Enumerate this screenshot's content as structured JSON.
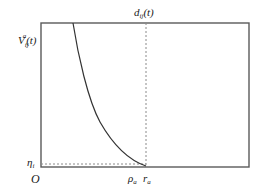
{
  "diagram": {
    "type": "function-plot",
    "labels": {
      "y_top": "V",
      "y_top_sub": "ij",
      "y_top_sup": "a",
      "y_top_arg": "(t)",
      "y_bottom": "η",
      "y_bottom_sub": "i",
      "origin": "O",
      "x_rho": "ρ",
      "x_rho_sub": "a",
      "x_r": "r",
      "x_r_sub": "a",
      "top_right": "d",
      "top_right_sub": "ij",
      "top_right_arg": "(t)"
    },
    "colors": {
      "axis": "#555555",
      "curve": "#333333",
      "dashed": "#888888",
      "text": "#1a1a1a"
    }
  }
}
